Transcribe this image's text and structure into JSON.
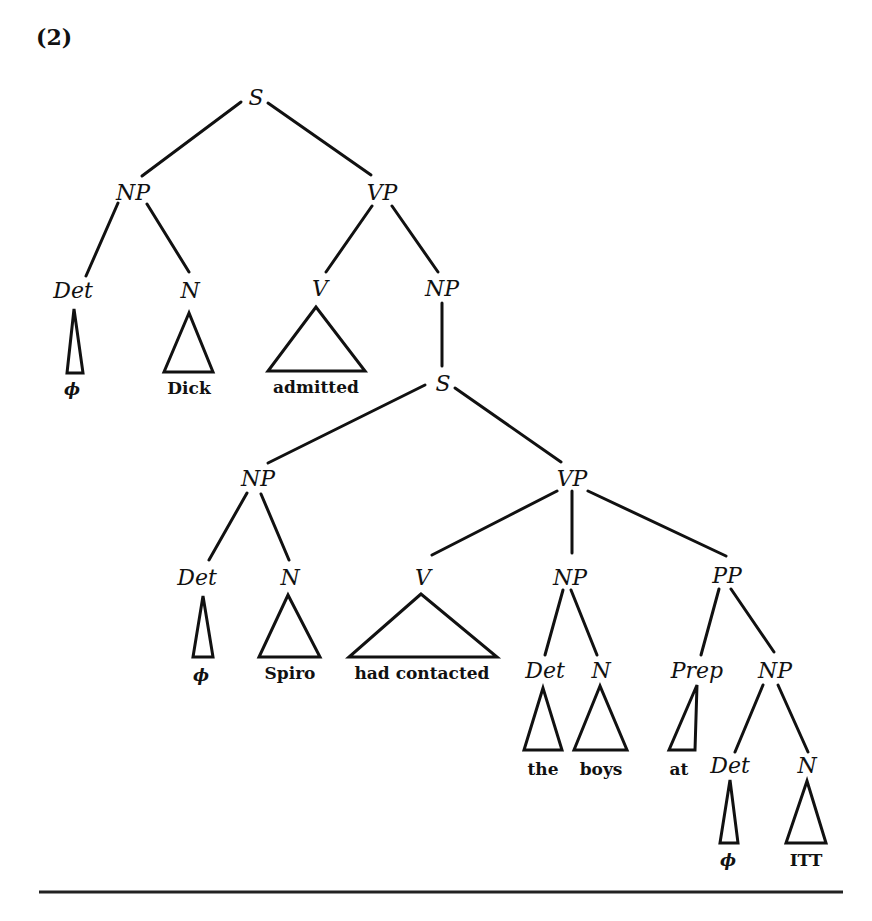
{
  "example_number": "(2)",
  "tree": {
    "nodes": [
      {
        "id": "s1",
        "label": "S",
        "x": 256,
        "y": 97
      },
      {
        "id": "np1",
        "label": "NP",
        "x": 133,
        "y": 192
      },
      {
        "id": "vp1",
        "label": "VP",
        "x": 382,
        "y": 192
      },
      {
        "id": "det1",
        "label": "Det",
        "x": 73,
        "y": 290
      },
      {
        "id": "n1",
        "label": "N",
        "x": 190,
        "y": 290
      },
      {
        "id": "v1",
        "label": "V",
        "x": 320,
        "y": 288
      },
      {
        "id": "np2",
        "label": "NP",
        "x": 442,
        "y": 288
      },
      {
        "id": "s2",
        "label": "S",
        "x": 443,
        "y": 383
      },
      {
        "id": "np3",
        "label": "NP",
        "x": 258,
        "y": 478
      },
      {
        "id": "vp2",
        "label": "VP",
        "x": 572,
        "y": 478
      },
      {
        "id": "det2",
        "label": "Det",
        "x": 197,
        "y": 577
      },
      {
        "id": "n2",
        "label": "N",
        "x": 290,
        "y": 577
      },
      {
        "id": "v2",
        "label": "V",
        "x": 423,
        "y": 577
      },
      {
        "id": "np4",
        "label": "NP",
        "x": 570,
        "y": 577
      },
      {
        "id": "pp1",
        "label": "PP",
        "x": 727,
        "y": 575
      },
      {
        "id": "det3",
        "label": "Det",
        "x": 545,
        "y": 670
      },
      {
        "id": "n3",
        "label": "N",
        "x": 601,
        "y": 670
      },
      {
        "id": "prep1",
        "label": "Prep",
        "x": 697,
        "y": 670
      },
      {
        "id": "np5",
        "label": "NP",
        "x": 775,
        "y": 670
      },
      {
        "id": "det4",
        "label": "Det",
        "x": 730,
        "y": 765
      },
      {
        "id": "n4",
        "label": "N",
        "x": 807,
        "y": 765
      }
    ],
    "edges": [
      {
        "from": [
          241,
          102
        ],
        "to": [
          142,
          176
        ]
      },
      {
        "from": [
          268,
          103
        ],
        "to": [
          371,
          175
        ]
      },
      {
        "from": [
          118,
          203
        ],
        "to": [
          86,
          276
        ]
      },
      {
        "from": [
          147,
          204
        ],
        "to": [
          189,
          272
        ]
      },
      {
        "from": [
          372,
          206
        ],
        "to": [
          326,
          272
        ]
      },
      {
        "from": [
          392,
          206
        ],
        "to": [
          438,
          272
        ]
      },
      {
        "from": [
          442,
          303
        ],
        "to": [
          442,
          366
        ]
      },
      {
        "from": [
          425,
          385
        ],
        "to": [
          268,
          463
        ]
      },
      {
        "from": [
          455,
          388
        ],
        "to": [
          561,
          462
        ]
      },
      {
        "from": [
          247,
          493
        ],
        "to": [
          209,
          560
        ]
      },
      {
        "from": [
          261,
          494
        ],
        "to": [
          289,
          560
        ]
      },
      {
        "from": [
          557,
          491
        ],
        "to": [
          432,
          555
        ]
      },
      {
        "from": [
          572,
          491
        ],
        "to": [
          572,
          553
        ]
      },
      {
        "from": [
          588,
          491
        ],
        "to": [
          726,
          556
        ]
      },
      {
        "from": [
          563,
          590
        ],
        "to": [
          545,
          655
        ]
      },
      {
        "from": [
          571,
          590
        ],
        "to": [
          597,
          655
        ]
      },
      {
        "from": [
          719,
          589
        ],
        "to": [
          701,
          655
        ]
      },
      {
        "from": [
          731,
          589
        ],
        "to": [
          774,
          652
        ]
      },
      {
        "from": [
          763,
          685
        ],
        "to": [
          735,
          752
        ]
      },
      {
        "from": [
          778,
          685
        ],
        "to": [
          808,
          752
        ]
      }
    ],
    "triangles": [
      {
        "apex": [
          74,
          309
        ],
        "base": [
          [
            67,
            373
          ],
          [
            83,
            373
          ]
        ],
        "leaf": "ϕ",
        "leaf_x": 72,
        "leaf_y": 395
      },
      {
        "apex": [
          189,
          313
        ],
        "base": [
          [
            164,
            372
          ],
          [
            213,
            372
          ]
        ],
        "leaf": "Dick",
        "leaf_x": 189,
        "leaf_y": 394
      },
      {
        "apex": [
          316,
          307
        ],
        "base": [
          [
            268,
            371
          ],
          [
            365,
            371
          ]
        ],
        "leaf": "admitted",
        "leaf_x": 316,
        "leaf_y": 393
      },
      {
        "apex": [
          203,
          596
        ],
        "base": [
          [
            193,
            657
          ],
          [
            213,
            657
          ]
        ],
        "leaf": "ϕ",
        "leaf_x": 201,
        "leaf_y": 681
      },
      {
        "apex": [
          288,
          595
        ],
        "base": [
          [
            259,
            657
          ],
          [
            320,
            657
          ]
        ],
        "leaf": "Spiro",
        "leaf_x": 290,
        "leaf_y": 679
      },
      {
        "apex": [
          421,
          594
        ],
        "base": [
          [
            349,
            657
          ],
          [
            497,
            657
          ]
        ],
        "leaf": "had contacted",
        "leaf_x": 422,
        "leaf_y": 679
      },
      {
        "apex": [
          543,
          688
        ],
        "base": [
          [
            524,
            750
          ],
          [
            562,
            750
          ]
        ],
        "leaf": "the",
        "leaf_x": 543,
        "leaf_y": 775
      },
      {
        "apex": [
          600,
          686
        ],
        "base": [
          [
            574,
            750
          ],
          [
            627,
            750
          ]
        ],
        "leaf": "boys",
        "leaf_x": 601,
        "leaf_y": 775
      },
      {
        "apex": [
          697,
          685
        ],
        "base": [
          [
            669,
            750
          ],
          [
            695,
            750
          ]
        ],
        "leaf": "at",
        "leaf_x": 679,
        "leaf_y": 775
      },
      {
        "apex": [
          730,
          780
        ],
        "base": [
          [
            720,
            843
          ],
          [
            738,
            843
          ]
        ],
        "leaf": "ϕ",
        "leaf_x": 728,
        "leaf_y": 866
      },
      {
        "apex": [
          807,
          781
        ],
        "base": [
          [
            786,
            843
          ],
          [
            826,
            843
          ]
        ],
        "leaf": "ITT",
        "leaf_x": 806,
        "leaf_y": 866
      }
    ]
  },
  "rule": {
    "x1": 39,
    "x2": 843,
    "y": 892
  }
}
